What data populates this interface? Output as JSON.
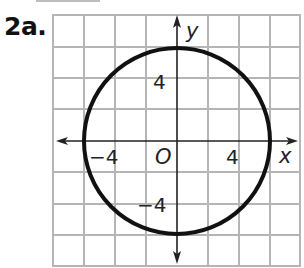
{
  "problem": {
    "label": "2a."
  },
  "graph": {
    "axis_labels": {
      "x": "x",
      "y": "y",
      "origin": "O"
    },
    "tick_labels": {
      "x_negative": "−4",
      "x_positive": "4",
      "y_positive": "4",
      "y_negative": "−4"
    },
    "grid": {
      "columns": 8,
      "rows": 8,
      "units_per_cell": 2,
      "range": [
        -8,
        8
      ]
    },
    "shape": {
      "type": "circle",
      "center": [
        0,
        0
      ],
      "radius": 6,
      "equation": "x^2 + y^2 = 36"
    },
    "colors": {
      "grid": "#b5b5b5",
      "axis": "#222222",
      "curve": "#111111"
    }
  }
}
